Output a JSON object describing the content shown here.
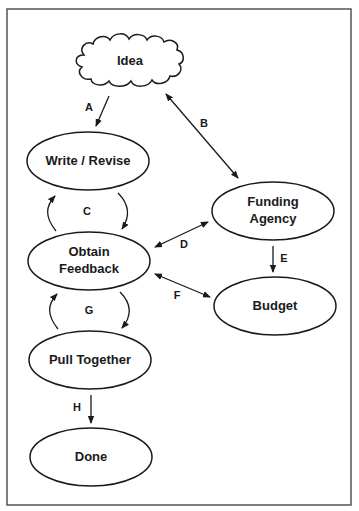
{
  "diagram": {
    "type": "flowchart",
    "colors": {
      "stroke": "#1a1a1a",
      "background": "#ffffff",
      "frame": "#555555"
    },
    "nodes": {
      "idea": {
        "label": "Idea",
        "shape": "cloud"
      },
      "write_revise": {
        "label": "Write / Revise",
        "shape": "ellipse"
      },
      "funding_agency": {
        "label_line1": "Funding",
        "label_line2": "Agency",
        "shape": "ellipse"
      },
      "obtain_feedback": {
        "label_line1": "Obtain",
        "label_line2": "Feedback",
        "shape": "ellipse"
      },
      "budget": {
        "label": "Budget",
        "shape": "ellipse"
      },
      "pull_together": {
        "label": "Pull Together",
        "shape": "ellipse"
      },
      "done": {
        "label": "Done",
        "shape": "ellipse"
      }
    },
    "edges": {
      "a": {
        "label": "A",
        "from": "Idea",
        "to": "Write / Revise",
        "direction": "forward"
      },
      "b": {
        "label": "B",
        "from": "Idea",
        "to": "Funding Agency",
        "direction": "both"
      },
      "c": {
        "label": "C",
        "from": "Write / Revise",
        "to": "Obtain Feedback",
        "direction": "cycle"
      },
      "d": {
        "label": "D",
        "from": "Obtain Feedback",
        "to": "Funding Agency",
        "direction": "both"
      },
      "e": {
        "label": "E",
        "from": "Funding Agency",
        "to": "Budget",
        "direction": "forward"
      },
      "f": {
        "label": "F",
        "from": "Obtain Feedback",
        "to": "Budget",
        "direction": "both"
      },
      "g": {
        "label": "G",
        "from": "Obtain Feedback",
        "to": "Pull Together",
        "direction": "cycle"
      },
      "h": {
        "label": "H",
        "from": "Pull Together",
        "to": "Done",
        "direction": "forward"
      }
    }
  }
}
